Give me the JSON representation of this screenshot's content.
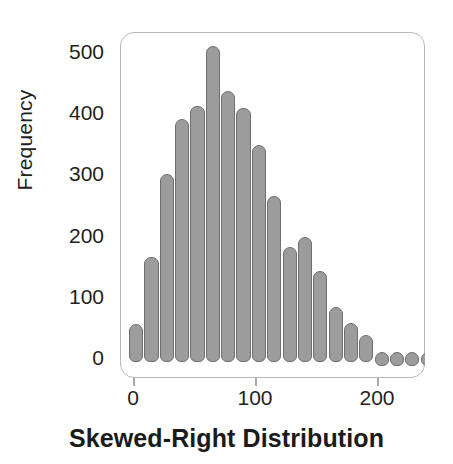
{
  "chart_data": {
    "type": "bar",
    "title": "Skewed-Right Distribution",
    "xlabel": "",
    "ylabel": "Frequency",
    "grid": false,
    "legend": null,
    "xlim": [
      -6,
      243
    ],
    "ylim": [
      0,
      530
    ],
    "xticks": [
      0,
      100,
      200
    ],
    "xtick_labels": [
      "0",
      "100",
      "200"
    ],
    "yticks": [
      0,
      100,
      200,
      300,
      400,
      500
    ],
    "ytick_labels": [
      "0",
      "100",
      "200",
      "300",
      "400",
      "500"
    ],
    "bin_width": 12.5,
    "bin_centers": [
      6,
      18,
      31,
      43,
      56,
      68,
      81,
      93,
      106,
      118,
      131,
      143,
      156,
      168,
      181,
      193,
      206,
      212,
      219,
      226
    ],
    "categories": [
      "6",
      "18",
      "31",
      "43",
      "56",
      "68",
      "81",
      "93",
      "106",
      "118",
      "131",
      "143",
      "156",
      "168",
      "181",
      "193",
      "200",
      "209",
      "218",
      "226"
    ],
    "values": [
      55,
      165,
      300,
      390,
      412,
      509,
      437,
      408,
      348,
      265,
      182,
      197,
      142,
      83,
      57,
      38,
      10,
      9,
      9,
      9
    ],
    "bar_color": "#9c9c9c",
    "bar_edge_color": "#6f6f6f",
    "frame_color": "#b9b9b9",
    "tick_color": "#a9a9a9",
    "text_color": "#231f20"
  },
  "axes": {
    "y_label": "Frequency",
    "y_ticks": [
      "500",
      "400",
      "300",
      "200",
      "100",
      "0"
    ],
    "x_ticks": [
      "0",
      "100",
      "200"
    ]
  },
  "caption": {
    "text": "Skewed-Right Distribution"
  }
}
